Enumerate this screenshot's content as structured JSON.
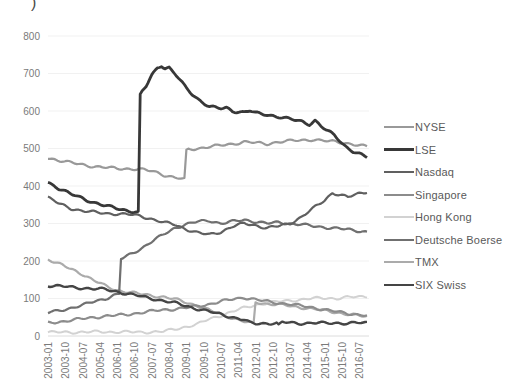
{
  "page": {
    "title_fragment": ")"
  },
  "chart_data": {
    "type": "line",
    "title": "",
    "xlabel": "",
    "ylabel": "",
    "x_unit": "months since 2003-01",
    "months_total": 166,
    "ylim": [
      0,
      800
    ],
    "y_ticks": [
      0,
      100,
      200,
      300,
      400,
      500,
      600,
      700,
      800
    ],
    "x_tick_labels": [
      "2003-01",
      "2003-10",
      "2004-07",
      "2005-04",
      "2006-01",
      "2006-10",
      "2007-07",
      "2008-04",
      "2009-01",
      "2009-10",
      "2010-07",
      "2011-04",
      "2012-01",
      "2012-10",
      "2013-07",
      "2014-04",
      "2015-01",
      "2015-10",
      "2016-07"
    ],
    "x_tick_step_months": 9,
    "grid": "horizontal-faint",
    "legend_position": "right",
    "draw_order": [
      "Hong Kong",
      "TMX",
      "NYSE",
      "Singapore",
      "Deutsche Boerse",
      "Nasdaq",
      "SIX Swiss",
      "LSE"
    ],
    "series": [
      {
        "name": "NYSE",
        "color": "#999999",
        "width": 2.2,
        "points": [
          [
            0,
            475
          ],
          [
            6,
            468
          ],
          [
            12,
            462
          ],
          [
            18,
            457
          ],
          [
            24,
            452
          ],
          [
            30,
            449
          ],
          [
            36,
            447
          ],
          [
            42,
            446
          ],
          [
            48,
            444
          ],
          [
            54,
            440
          ],
          [
            57,
            436
          ],
          [
            60,
            430
          ],
          [
            66,
            422
          ],
          [
            71,
            418
          ],
          [
            72,
            497
          ],
          [
            78,
            500
          ],
          [
            84,
            505
          ],
          [
            90,
            508
          ],
          [
            96,
            512
          ],
          [
            102,
            518
          ],
          [
            108,
            515
          ],
          [
            114,
            512
          ],
          [
            120,
            518
          ],
          [
            126,
            520
          ],
          [
            132,
            522
          ],
          [
            138,
            524
          ],
          [
            144,
            520
          ],
          [
            150,
            518
          ],
          [
            156,
            514
          ],
          [
            162,
            508
          ],
          [
            166,
            505
          ]
        ]
      },
      {
        "name": "LSE",
        "color": "#383838",
        "width": 2.8,
        "points": [
          [
            0,
            410
          ],
          [
            6,
            393
          ],
          [
            12,
            378
          ],
          [
            18,
            367
          ],
          [
            24,
            356
          ],
          [
            30,
            347
          ],
          [
            36,
            340
          ],
          [
            42,
            334
          ],
          [
            47,
            330
          ],
          [
            48,
            645
          ],
          [
            51,
            665
          ],
          [
            54,
            695
          ],
          [
            57,
            715
          ],
          [
            59,
            722
          ],
          [
            61,
            714
          ],
          [
            63,
            716
          ],
          [
            66,
            700
          ],
          [
            69,
            680
          ],
          [
            72,
            660
          ],
          [
            75,
            645
          ],
          [
            78,
            632
          ],
          [
            81,
            622
          ],
          [
            84,
            612
          ],
          [
            90,
            606
          ],
          [
            93,
            608
          ],
          [
            96,
            600
          ],
          [
            102,
            597
          ],
          [
            105,
            601
          ],
          [
            108,
            594
          ],
          [
            114,
            590
          ],
          [
            120,
            585
          ],
          [
            126,
            578
          ],
          [
            132,
            572
          ],
          [
            136,
            565
          ],
          [
            139,
            575
          ],
          [
            142,
            560
          ],
          [
            145,
            548
          ],
          [
            149,
            535
          ],
          [
            152,
            520
          ],
          [
            155,
            505
          ],
          [
            159,
            492
          ],
          [
            163,
            483
          ],
          [
            166,
            476
          ]
        ]
      },
      {
        "name": "Nasdaq",
        "color": "#606060",
        "width": 2.2,
        "points": [
          [
            0,
            370
          ],
          [
            6,
            352
          ],
          [
            12,
            340
          ],
          [
            18,
            334
          ],
          [
            24,
            330
          ],
          [
            30,
            327
          ],
          [
            36,
            326
          ],
          [
            42,
            324
          ],
          [
            48,
            320
          ],
          [
            54,
            312
          ],
          [
            60,
            303
          ],
          [
            66,
            297
          ],
          [
            72,
            285
          ],
          [
            78,
            275
          ],
          [
            84,
            270
          ],
          [
            90,
            278
          ],
          [
            96,
            292
          ],
          [
            102,
            300
          ],
          [
            108,
            295
          ],
          [
            114,
            288
          ],
          [
            120,
            293
          ],
          [
            126,
            300
          ],
          [
            132,
            318
          ],
          [
            138,
            340
          ],
          [
            144,
            362
          ],
          [
            148,
            382
          ],
          [
            153,
            375
          ],
          [
            156,
            370
          ],
          [
            162,
            380
          ],
          [
            166,
            385
          ]
        ]
      },
      {
        "name": "Singapore",
        "color": "#8c8c8c",
        "width": 2.2,
        "points": [
          [
            0,
            35
          ],
          [
            6,
            38
          ],
          [
            12,
            42
          ],
          [
            18,
            46
          ],
          [
            24,
            50
          ],
          [
            30,
            53
          ],
          [
            36,
            55
          ],
          [
            42,
            58
          ],
          [
            48,
            62
          ],
          [
            54,
            66
          ],
          [
            60,
            70
          ],
          [
            66,
            72
          ],
          [
            72,
            75
          ],
          [
            78,
            80
          ],
          [
            84,
            85
          ],
          [
            90,
            92
          ],
          [
            96,
            98
          ],
          [
            102,
            103
          ],
          [
            108,
            97
          ],
          [
            114,
            92
          ],
          [
            120,
            88
          ],
          [
            126,
            85
          ],
          [
            132,
            80
          ],
          [
            138,
            76
          ],
          [
            144,
            70
          ],
          [
            150,
            65
          ],
          [
            156,
            60
          ],
          [
            162,
            57
          ],
          [
            166,
            55
          ]
        ]
      },
      {
        "name": "Hong Kong",
        "color": "#d2d2d2",
        "width": 2.0,
        "points": [
          [
            0,
            10
          ],
          [
            12,
            10
          ],
          [
            24,
            11
          ],
          [
            36,
            11
          ],
          [
            48,
            10
          ],
          [
            54,
            11
          ],
          [
            60,
            12
          ],
          [
            66,
            18
          ],
          [
            72,
            25
          ],
          [
            78,
            32
          ],
          [
            84,
            45
          ],
          [
            90,
            55
          ],
          [
            96,
            65
          ],
          [
            102,
            75
          ],
          [
            108,
            83
          ],
          [
            114,
            88
          ],
          [
            120,
            92
          ],
          [
            126,
            95
          ],
          [
            132,
            97
          ],
          [
            138,
            100
          ],
          [
            144,
            102
          ],
          [
            150,
            100
          ],
          [
            156,
            103
          ],
          [
            162,
            105
          ],
          [
            166,
            106
          ]
        ]
      },
      {
        "name": "Deutsche Boerse",
        "color": "#707070",
        "width": 2.2,
        "points": [
          [
            0,
            62
          ],
          [
            6,
            68
          ],
          [
            12,
            75
          ],
          [
            18,
            82
          ],
          [
            24,
            92
          ],
          [
            30,
            100
          ],
          [
            34,
            108
          ],
          [
            37,
            112
          ],
          [
            38,
            205
          ],
          [
            42,
            215
          ],
          [
            48,
            232
          ],
          [
            54,
            252
          ],
          [
            60,
            270
          ],
          [
            66,
            288
          ],
          [
            72,
            298
          ],
          [
            78,
            305
          ],
          [
            84,
            308
          ],
          [
            90,
            300
          ],
          [
            96,
            305
          ],
          [
            102,
            310
          ],
          [
            108,
            305
          ],
          [
            114,
            300
          ],
          [
            120,
            303
          ],
          [
            126,
            300
          ],
          [
            132,
            297
          ],
          [
            138,
            293
          ],
          [
            144,
            290
          ],
          [
            150,
            287
          ],
          [
            156,
            284
          ],
          [
            162,
            280
          ],
          [
            166,
            278
          ]
        ]
      },
      {
        "name": "TMX",
        "color": "#ababab",
        "width": 2.2,
        "points": [
          [
            0,
            205
          ],
          [
            9,
            185
          ],
          [
            18,
            165
          ],
          [
            24,
            148
          ],
          [
            30,
            133
          ],
          [
            36,
            122
          ],
          [
            42,
            117
          ],
          [
            48,
            112
          ],
          [
            54,
            108
          ],
          [
            60,
            104
          ],
          [
            66,
            98
          ],
          [
            72,
            90
          ],
          [
            78,
            80
          ],
          [
            84,
            68
          ],
          [
            90,
            58
          ],
          [
            96,
            48
          ],
          [
            102,
            38
          ],
          [
            107,
            32
          ],
          [
            108,
            90
          ],
          [
            114,
            86
          ],
          [
            120,
            84
          ],
          [
            126,
            80
          ],
          [
            132,
            76
          ],
          [
            138,
            72
          ],
          [
            144,
            68
          ],
          [
            150,
            63
          ],
          [
            156,
            58
          ],
          [
            162,
            54
          ],
          [
            166,
            52
          ]
        ]
      },
      {
        "name": "SIX Swiss",
        "color": "#454545",
        "width": 2.4,
        "points": [
          [
            0,
            135
          ],
          [
            6,
            133
          ],
          [
            12,
            130
          ],
          [
            18,
            128
          ],
          [
            24,
            126
          ],
          [
            30,
            124
          ],
          [
            36,
            118
          ],
          [
            42,
            112
          ],
          [
            48,
            106
          ],
          [
            54,
            100
          ],
          [
            60,
            94
          ],
          [
            66,
            88
          ],
          [
            72,
            80
          ],
          [
            78,
            72
          ],
          [
            84,
            65
          ],
          [
            90,
            58
          ],
          [
            96,
            50
          ],
          [
            102,
            43
          ],
          [
            105,
            35
          ],
          [
            108,
            33
          ],
          [
            114,
            34
          ],
          [
            119,
            34
          ],
          [
            120,
            28
          ],
          [
            122,
            37
          ],
          [
            126,
            35
          ],
          [
            132,
            34
          ],
          [
            138,
            35
          ],
          [
            144,
            34
          ],
          [
            150,
            35
          ],
          [
            156,
            34
          ],
          [
            162,
            35
          ],
          [
            166,
            35
          ]
        ]
      }
    ]
  }
}
